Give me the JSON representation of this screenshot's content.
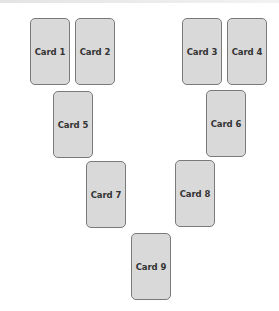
{
  "cards": [
    {
      "label": "Card 1",
      "x": 30,
      "y": 18
    },
    {
      "label": "Card 2",
      "x": 75,
      "y": 18
    },
    {
      "label": "Card 3",
      "x": 182,
      "y": 18
    },
    {
      "label": "Card 4",
      "x": 227,
      "y": 18
    },
    {
      "label": "Card 5",
      "x": 53,
      "y": 91
    },
    {
      "label": "Card 6",
      "x": 206,
      "y": 90
    },
    {
      "label": "Card 7",
      "x": 86,
      "y": 161
    },
    {
      "label": "Card 8",
      "x": 175,
      "y": 160
    },
    {
      "label": "Card 9",
      "x": 131,
      "y": 233
    }
  ],
  "colors": {
    "card_fill": "#d9d9d9",
    "card_border": "#7a7a7a",
    "label_text": "#333333",
    "background": "#ffffff"
  }
}
